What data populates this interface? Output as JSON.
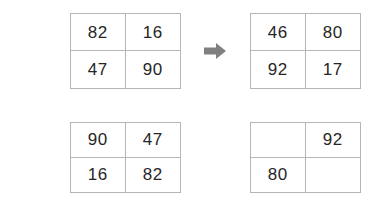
{
  "canvas": {
    "width": 386,
    "height": 212,
    "background": "#ffffff",
    "border_color": "#b5b5b5",
    "digit_color": "#262626",
    "arrow_color": "#808080"
  },
  "icons": {
    "arrow_right": "arrow-right-icon"
  },
  "sequence": {
    "rows": [
      {
        "name": "row-1",
        "grids": [
          {
            "name": "grid-1",
            "cells": [
              {
                "value": "82"
              },
              {
                "value": "16"
              },
              {
                "value": "47"
              },
              {
                "value": "90"
              }
            ]
          },
          {
            "name": "grid-2",
            "cells": [
              {
                "value": "46"
              },
              {
                "value": "80"
              },
              {
                "value": "92"
              },
              {
                "value": "17"
              }
            ]
          }
        ]
      },
      {
        "name": "row-2",
        "grids": [
          {
            "name": "grid-3",
            "cells": [
              {
                "value": "90"
              },
              {
                "value": "47"
              },
              {
                "value": "16"
              },
              {
                "value": "82"
              }
            ]
          },
          {
            "name": "grid-4",
            "cells": [
              {
                "value": ""
              },
              {
                "value": "92"
              },
              {
                "value": "80"
              },
              {
                "value": ""
              }
            ]
          }
        ]
      }
    ]
  }
}
